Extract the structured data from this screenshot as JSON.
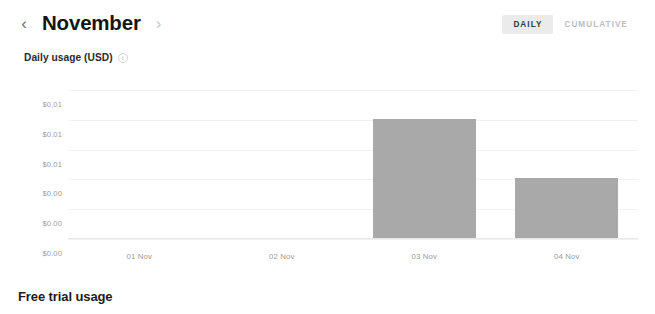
{
  "header": {
    "prev_icon": "chevron-left-icon",
    "prev_label": "‹",
    "month": "November",
    "next_icon": "chevron-right-icon",
    "next_label": "›"
  },
  "toggle": {
    "options": [
      {
        "label": "DAILY",
        "active": true
      },
      {
        "label": "CUMULATIVE",
        "active": false
      }
    ],
    "daily_label": "DAILY",
    "cumulative_label": "CUMULATIVE"
  },
  "section": {
    "label": "Daily usage (USD)",
    "info_icon": "info-icon",
    "info_glyph": "i"
  },
  "footer": {
    "heading": "Free trial usage"
  },
  "colors": {
    "bar": "#a9a9a9",
    "toggle_active_bg": "#ebebeb",
    "gridline": "#f1f1f1",
    "axis_text": "#9c9c9c"
  },
  "chart_data": {
    "type": "bar",
    "title": "Daily usage (USD)",
    "xlabel": "",
    "ylabel": "",
    "categories": [
      "01 Nov",
      "02 Nov",
      "03 Nov",
      "04 Nov"
    ],
    "values": [
      0,
      0,
      0.0092,
      0.0046
    ],
    "ytick_labels": [
      "$0.01",
      "$0.01",
      "$0.01",
      "$0.00",
      "$0.00",
      "$0.00"
    ],
    "ytick_values": [
      0.01,
      0.01,
      0.01,
      0.0,
      0.0,
      0.0
    ],
    "ylim": [
      0,
      0.0115
    ],
    "grid": true,
    "legend": "none"
  }
}
